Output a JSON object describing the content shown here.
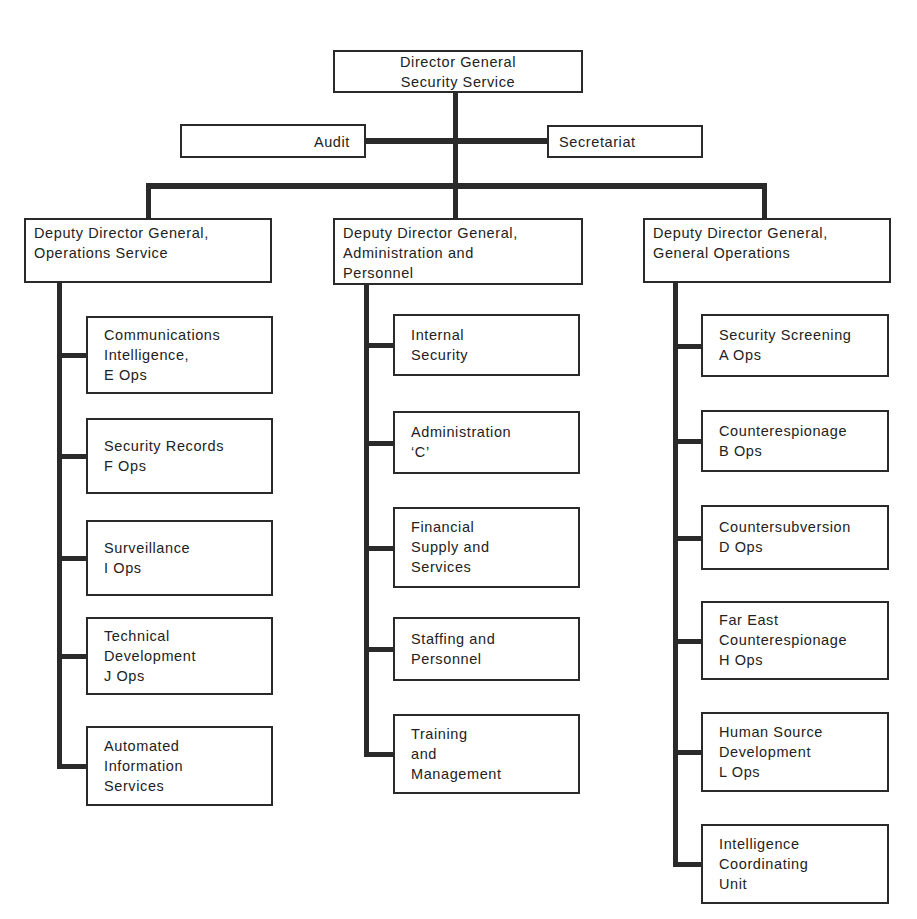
{
  "chart": {
    "director": {
      "label": "Director General\nSecurity Service"
    },
    "staff": [
      {
        "id": "audit",
        "label": "Audit"
      },
      {
        "id": "secretariat",
        "label": "Secretariat"
      }
    ],
    "deputies": [
      {
        "label": "Deputy Director General,\nOperations Service",
        "units": [
          "Communications\nIntelligence,\nE Ops",
          "Security Records\nF Ops",
          "Surveillance\nI Ops",
          "Technical\nDevelopment\nJ Ops",
          "Automated\nInformation\nServices"
        ]
      },
      {
        "label": "Deputy Director General,\nAdministration and\nPersonnel",
        "units": [
          "Internal\nSecurity",
          "Administration\n‘C’",
          "Financial\nSupply and\nServices",
          "Staffing and\nPersonnel",
          "Training\nand\nManagement"
        ]
      },
      {
        "label": "Deputy Director General,\nGeneral Operations",
        "units": [
          "Security Screening\nA Ops",
          "Counterespionage\nB Ops",
          "Countersubversion\nD Ops",
          "Far East\nCounterespionage\nH Ops",
          "Human Source\nDevelopment\nL Ops",
          "Intelligence\nCoordinating\nUnit"
        ]
      }
    ]
  }
}
